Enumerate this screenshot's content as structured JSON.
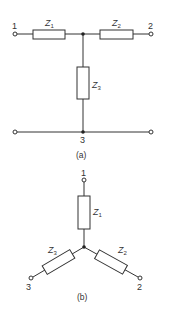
{
  "diagram": {
    "type": "circuit",
    "colors": {
      "line": "#333333",
      "background": "#ffffff"
    },
    "circuit_a": {
      "caption": "(a)",
      "description": "T-network",
      "terminals": [
        {
          "id": "1",
          "label": "1"
        },
        {
          "id": "2",
          "label": "2"
        },
        {
          "id": "3",
          "label": "3"
        }
      ],
      "impedances": [
        {
          "name": "Z",
          "sub": "1"
        },
        {
          "name": "Z",
          "sub": "2"
        },
        {
          "name": "Z",
          "sub": "3"
        }
      ]
    },
    "circuit_b": {
      "caption": "(b)",
      "description": "Star (Y) network",
      "terminals": [
        {
          "id": "1",
          "label": "1"
        },
        {
          "id": "2",
          "label": "2"
        },
        {
          "id": "3",
          "label": "3"
        }
      ],
      "impedances": [
        {
          "name": "Z",
          "sub": "1"
        },
        {
          "name": "Z",
          "sub": "2"
        },
        {
          "name": "Z",
          "sub": "3"
        }
      ]
    }
  }
}
